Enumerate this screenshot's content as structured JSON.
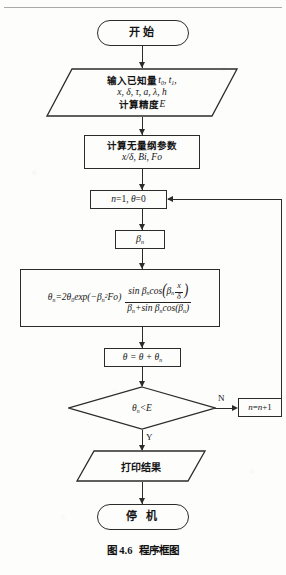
{
  "figure": {
    "caption_number": "图 4.6",
    "caption_title": "程序框图"
  },
  "nodes": {
    "start": {
      "label": "开始",
      "shape": "terminator"
    },
    "input": {
      "shape": "parallelogram",
      "line1_prefix": "输入已知量",
      "line1_vars": "t0, t1,",
      "line2": "x, δ, τ, a, λ, h",
      "line3_prefix": "计算精度",
      "line3_var": "E"
    },
    "dimensionless": {
      "shape": "process",
      "line1": "计算无量纲参数",
      "line2": "x/δ, Bi, Fo"
    },
    "init": {
      "shape": "process",
      "label": "n=1, θ=0"
    },
    "beta": {
      "shape": "process",
      "label": "βn"
    },
    "formula": {
      "shape": "process",
      "lhs": "θn=2θ0exp(−βn²Fo)",
      "numerator": "sin βn cos(βn x/δ)",
      "denominator": "βn + sin βn cos(βn)"
    },
    "accumulate": {
      "shape": "process",
      "label": "θ = θ + θn"
    },
    "decision": {
      "shape": "diamond",
      "label": "θn<E"
    },
    "increment": {
      "shape": "process",
      "label": "n=n+1"
    },
    "print": {
      "shape": "parallelogram",
      "label": "打印结果"
    },
    "stop": {
      "label": "停 机",
      "shape": "terminator"
    }
  },
  "edges": {
    "no_label": "N",
    "yes_label": "Y"
  },
  "colors": {
    "stroke": "#2b2b2b",
    "text": "#141414",
    "background": "#fdfdfc",
    "rule": "#a9a9a6"
  }
}
